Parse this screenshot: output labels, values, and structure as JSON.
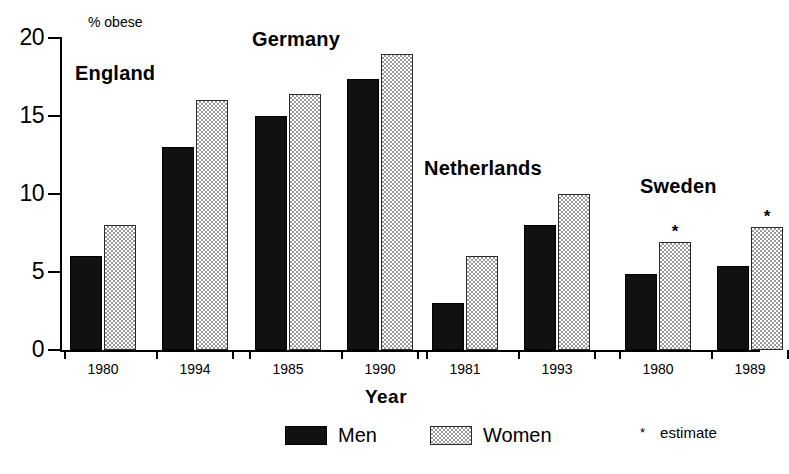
{
  "chart_data": {
    "type": "bar",
    "title": "",
    "xlabel": "Year",
    "ylabel": "% obese",
    "ylim": [
      0,
      20
    ],
    "yticks": [
      0,
      5,
      10,
      15,
      20
    ],
    "grid": false,
    "legend_position": "bottom",
    "series": [
      {
        "name": "Men",
        "color": "#111111"
      },
      {
        "name": "Women",
        "color": "#9a9a9a"
      }
    ],
    "legend_note": "estimate",
    "legend_note_marker": "*",
    "groups": [
      {
        "country": "England",
        "bars": [
          {
            "year": "1980",
            "men": 6.0,
            "women": 8.0,
            "men_estimate": false,
            "women_estimate": false
          },
          {
            "year": "1994",
            "men": 13.0,
            "women": 16.0,
            "men_estimate": false,
            "women_estimate": false
          }
        ]
      },
      {
        "country": "Germany",
        "bars": [
          {
            "year": "1985",
            "men": 15.0,
            "women": 16.4,
            "men_estimate": false,
            "women_estimate": false
          },
          {
            "year": "1990",
            "men": 17.4,
            "women": 19.0,
            "men_estimate": false,
            "women_estimate": false
          }
        ]
      },
      {
        "country": "Netherlands",
        "bars": [
          {
            "year": "1981",
            "men": 3.0,
            "women": 6.0,
            "men_estimate": false,
            "women_estimate": false
          },
          {
            "year": "1993",
            "men": 8.0,
            "women": 10.0,
            "men_estimate": false,
            "women_estimate": false
          }
        ]
      },
      {
        "country": "Sweden",
        "bars": [
          {
            "year": "1980",
            "men": 4.9,
            "women": 6.9,
            "men_estimate": false,
            "women_estimate": true
          },
          {
            "year": "1989",
            "men": 5.4,
            "women": 7.9,
            "men_estimate": false,
            "women_estimate": true
          }
        ]
      }
    ]
  },
  "layout": {
    "group_title_positions": [
      {
        "left": 75,
        "top": 62
      },
      {
        "left": 252,
        "top": 28
      },
      {
        "left": 424,
        "top": 157
      },
      {
        "left": 640,
        "top": 175
      }
    ],
    "group_x_origin": [
      70,
      255,
      432,
      625
    ],
    "pair_spacing": 92,
    "bar_width": 32,
    "bar_gap": 2
  }
}
